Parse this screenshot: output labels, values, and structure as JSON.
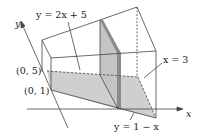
{
  "figure": {
    "type": "3d-solid-region",
    "colors": {
      "line": "#444444",
      "shade": "#c8c8c8",
      "shade_dark": "#8a8a8a",
      "background": "#ffffff"
    },
    "axes": {
      "x_label": "x",
      "y_label": "y"
    },
    "labels": {
      "top_curve": "y = 2x + 5",
      "plane": "x = 3",
      "bottom_curve": "y = 1 − x",
      "point_upper": "(0, 5)",
      "point_lower": "(0, 1)"
    }
  }
}
